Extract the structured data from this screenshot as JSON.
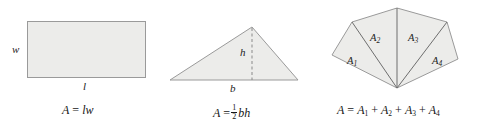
{
  "figure": {
    "background_color": "#ffffff",
    "shape_fill_color": "#ececea",
    "shape_stroke_color": "#9a9a9a",
    "inner_edge_color": "#6e6e6e"
  },
  "rectangle": {
    "name": "rectangle",
    "width_label": "w",
    "length_label": "l",
    "formula_parts": {
      "area_symbol": "A",
      "equals": "=",
      "expression": "lw"
    }
  },
  "triangle": {
    "name": "triangle",
    "height_label": "h",
    "base_label": "b",
    "formula_parts": {
      "area_symbol": "A",
      "equals": "=",
      "fraction_numerator": "1",
      "fraction_denominator": "2",
      "expression": "bh"
    }
  },
  "polygon": {
    "name": "triangulated-polygon",
    "region_labels": [
      {
        "base": "A",
        "subscript": "1"
      },
      {
        "base": "A",
        "subscript": "2"
      },
      {
        "base": "A",
        "subscript": "3"
      },
      {
        "base": "A",
        "subscript": "4"
      }
    ],
    "formula_parts": {
      "area_symbol": "A",
      "equals": "=",
      "term_base": "A",
      "plus": "+",
      "terms": [
        "1",
        "2",
        "3",
        "4"
      ]
    }
  }
}
